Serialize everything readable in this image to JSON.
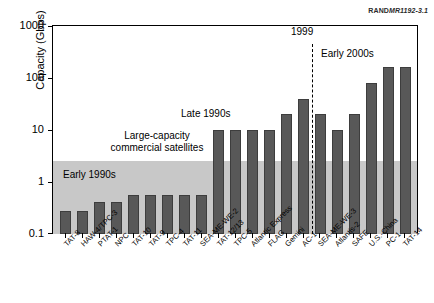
{
  "figure_id": {
    "prefix": "RAND",
    "number": "MR1192-3.1"
  },
  "axes": {
    "y_title": "Capacity (Gbps)",
    "y_ticks": [
      "1000",
      "100",
      "10",
      "1",
      "0.1"
    ]
  },
  "annotations": {
    "satellite_band_line1": "Large-capacity",
    "satellite_band_line2": "commercial satellites",
    "early_1990s": "Early 1990s",
    "late_1990s": "Late 1990s",
    "year_1999": "1999",
    "early_2000s": "Early 2000s"
  },
  "chart_data": {
    "type": "bar",
    "title": "",
    "xlabel": "",
    "ylabel": "Capacity (Gbps)",
    "yscale": "log",
    "ylim": [
      0.1,
      1000
    ],
    "ytick_values": [
      0.1,
      1,
      10,
      100,
      1000
    ],
    "grid": false,
    "legend": "none",
    "bar_color": "#585858",
    "categories": [
      "TAT-8",
      "HAW-4/TPC-3",
      "PTAT-1",
      "NPC",
      "TAT-10",
      "TAT-9",
      "TPC-4",
      "TAT-11",
      "SEA-ME-WE-2",
      "TAT-12/13",
      "TPC-5",
      "Atlantic Express",
      "FLAG",
      "Gemini",
      "AC-1",
      "SEA-ME-WE-3",
      "Atlantis-2",
      "SAFE",
      "U.S.-China",
      "PC-1",
      "TAT-14"
    ],
    "values": [
      0.28,
      0.28,
      0.42,
      0.42,
      0.56,
      0.56,
      0.56,
      0.56,
      0.56,
      10,
      10,
      10,
      10,
      20,
      40,
      20,
      10,
      20,
      80,
      160,
      160
    ],
    "eras": [
      {
        "label": "Early 1990s",
        "from": "TAT-8",
        "to": "SEA-ME-WE-2"
      },
      {
        "label": "Late 1990s",
        "from": "TAT-12/13",
        "to": "AC-1"
      },
      {
        "label": "Early 2000s",
        "from": "SEA-ME-WE-3",
        "to": "TAT-14"
      }
    ],
    "reference_line": {
      "label": "1999",
      "style": "dashed",
      "after_category": "AC-1"
    },
    "shaded_band": {
      "label": "Large-capacity commercial satellites",
      "y_from": 0.1,
      "y_to": 2.5,
      "color": "#c8c8c8"
    }
  }
}
